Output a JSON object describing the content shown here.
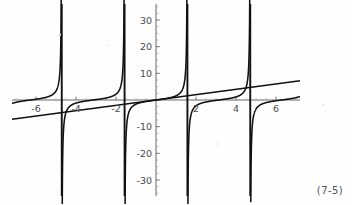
{
  "figure": {
    "caption": "(7-5)",
    "background_color": "#fefefe",
    "ink_color": "#111111",
    "axis_color": "#5a5a5a"
  },
  "chart_data": {
    "type": "line",
    "title": "",
    "subtitle": "",
    "xlabel": "",
    "ylabel": "",
    "xlim": [
      -7.2,
      7.2
    ],
    "ylim": [
      -36,
      36
    ],
    "grid": false,
    "legend": null,
    "x_ticks": [
      -6,
      -4,
      -2,
      2,
      4,
      6
    ],
    "x_tick_labels": [
      "-6",
      "-4",
      "-2",
      "2",
      "4",
      "6"
    ],
    "x_minor_tick_step": 0.5,
    "y_ticks": [
      -30,
      -20,
      -10,
      10,
      20,
      30
    ],
    "y_tick_labels": [
      "-30",
      "-20",
      "-10",
      "10",
      "20",
      "30"
    ],
    "y_minor_tick_step": 2.5,
    "asymptotes": [
      -4.712389,
      -1.570796,
      1.570796,
      4.712389
    ],
    "series": [
      {
        "name": "y = tan(x)",
        "type": "function",
        "function": "tan",
        "period": 3.14159265,
        "color": "#111111",
        "branches": [
          {
            "x_start": -7.2,
            "x_end": -4.712389
          },
          {
            "x_start": -4.712389,
            "x_end": -1.570796
          },
          {
            "x_start": -1.570796,
            "x_end": 1.570796
          },
          {
            "x_start": 1.570796,
            "x_end": 4.712389
          },
          {
            "x_start": 4.712389,
            "x_end": 7.2
          }
        ]
      },
      {
        "name": "y = x",
        "type": "line",
        "color": "#111111",
        "slope": 1,
        "intercept": 0,
        "x_start": -33,
        "x_end": 33,
        "points": [
          [
            -33,
            -33
          ],
          [
            33,
            33
          ]
        ]
      }
    ]
  },
  "notes": {
    "description": "Plot of y = tan(x) with vertical asymptotes, overlaid with the straight line y = x"
  }
}
